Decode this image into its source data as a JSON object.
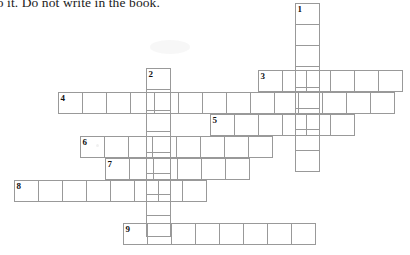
{
  "page": {
    "width": 410,
    "height": 255,
    "background_color": "#ffffff",
    "grid_line_color": "#999999",
    "text_color": "#1b1b1b"
  },
  "instruction": {
    "text": "nto it. Do not write in the book."
  },
  "puzzle": {
    "type": "crossword-grid",
    "cell_width": 25,
    "cell_height": 22,
    "entries": [
      {
        "number": "1",
        "direction": "down",
        "cells": 8,
        "x": 295,
        "y": 3
      },
      {
        "number": "2",
        "direction": "down",
        "cells": 8,
        "x": 146,
        "y": 68
      },
      {
        "number": "3",
        "direction": "across",
        "cells": 6,
        "x": 258,
        "y": 70
      },
      {
        "number": "4",
        "direction": "across",
        "cells": 14,
        "x": 58,
        "y": 92
      },
      {
        "number": "5",
        "direction": "across",
        "cells": 6,
        "x": 210,
        "y": 114
      },
      {
        "number": "6",
        "direction": "across",
        "cells": 8,
        "x": 80,
        "y": 136
      },
      {
        "number": "7",
        "direction": "across",
        "cells": 6,
        "x": 105,
        "y": 158
      },
      {
        "number": "8",
        "direction": "across",
        "cells": 8,
        "x": 14,
        "y": 180
      },
      {
        "number": "9",
        "direction": "across",
        "cells": 8,
        "x": 123,
        "y": 223
      }
    ]
  }
}
